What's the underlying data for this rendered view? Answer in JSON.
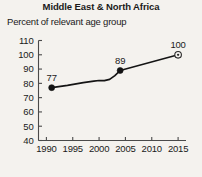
{
  "chart_data": {
    "type": "line",
    "title": "Middle East & North Africa",
    "subtitle": "Percent of relevant age group",
    "xlabel": "",
    "ylabel": "",
    "xlim": [
      1988.5,
      2016.5
    ],
    "ylim": [
      40,
      110
    ],
    "grid": false,
    "legend": null,
    "x_ticks": [
      1990,
      1995,
      2000,
      2005,
      2010,
      2015
    ],
    "x_tick_labels": [
      "1990",
      "1995",
      "2000",
      "2005",
      "2010",
      "2015"
    ],
    "y_ticks": [
      40,
      50,
      60,
      70,
      80,
      90,
      100,
      110
    ],
    "y_tick_labels": [
      "40",
      "50",
      "60",
      "70",
      "80",
      "90",
      "100",
      "110"
    ],
    "series": [
      {
        "name": "observed",
        "style": "solid-line-with-markers",
        "x": [
          1991,
          1994,
          1997,
          1999,
          2000,
          2001,
          2002,
          2003,
          2004
        ],
        "values": [
          77,
          78.6,
          80.5,
          81.6,
          82.0,
          81.9,
          82.8,
          85.4,
          89
        ]
      },
      {
        "name": "projection-to-target",
        "style": "solid-line",
        "x": [
          2004,
          2015
        ],
        "values": [
          89,
          100
        ]
      }
    ],
    "markers": [
      {
        "name": "start-point",
        "x": 1991,
        "value": 77,
        "label": "77",
        "style": "filled-circle"
      },
      {
        "name": "latest-point",
        "x": 2004,
        "value": 89,
        "label": "89",
        "style": "filled-circle"
      },
      {
        "name": "target-point",
        "x": 2015,
        "value": 100,
        "label": "100",
        "style": "target-circle"
      }
    ],
    "annotations": [
      {
        "name": "label-77",
        "text": "77"
      },
      {
        "name": "label-89",
        "text": "89"
      },
      {
        "name": "label-100",
        "text": "100"
      }
    ],
    "colors": {
      "background": "#f4f2ee",
      "line": "#141414",
      "axis": "#4a4a4a",
      "text": "#1a1a1a"
    }
  }
}
